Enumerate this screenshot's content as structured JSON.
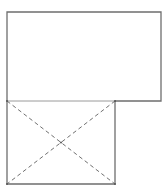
{
  "diagram": {
    "colors": {
      "background": "#ffffff",
      "stroke": "#6e6e6e",
      "shared_edge": "#9a9a9a",
      "dash": "#707070"
    },
    "shapes": {
      "upper_rect": {
        "x": 7,
        "y": 12,
        "width": 154,
        "height": 89
      },
      "lower_rect": {
        "x": 7,
        "y": 101,
        "width": 108,
        "height": 83
      },
      "diagonals": [
        {
          "x1": 7,
          "y1": 101,
          "x2": 115,
          "y2": 184
        },
        {
          "x1": 115,
          "y1": 101,
          "x2": 7,
          "y2": 184
        }
      ],
      "center_point": {
        "x": 61,
        "y": 142.5
      }
    }
  }
}
